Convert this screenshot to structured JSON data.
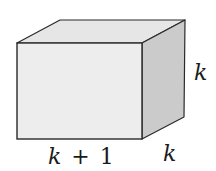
{
  "figure": {
    "shape": "rectangular prism",
    "labels": {
      "length": "k + 1",
      "length_var": "k",
      "length_op": "+",
      "length_const": "1",
      "height": "k",
      "depth": "k"
    },
    "colors": {
      "front_face": "#ececec",
      "top_face": "#e4e4e4",
      "side_face": "#c9c9c9",
      "edge": "#2a2a2a"
    }
  }
}
